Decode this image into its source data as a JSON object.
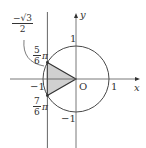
{
  "diagram": {
    "type": "unit-circle",
    "axes": {
      "x_label": "x",
      "y_label": "y",
      "origin_label": "O"
    },
    "ticks": {
      "x_pos": "1",
      "x_neg": "−1",
      "y_pos": "1",
      "y_neg": "−1"
    },
    "vertical_line_label": {
      "numerator": "−√3",
      "denominator": "2"
    },
    "angle_labels": [
      {
        "numerator": "5",
        "denominator": "6",
        "suffix": "π"
      },
      {
        "numerator": "7",
        "denominator": "6",
        "suffix": "π"
      }
    ],
    "shaded_region": "triangle O, angle 5π/6 point, angle 7π/6 point",
    "colors": {
      "stroke": "#333333",
      "fill": "#d0d0d0"
    }
  }
}
